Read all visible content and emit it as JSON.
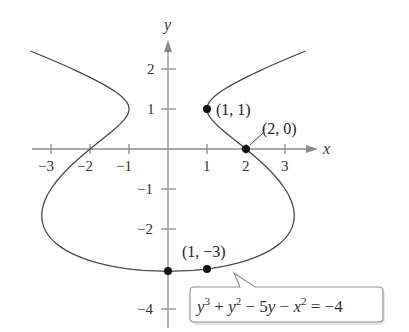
{
  "chart_data": {
    "type": "line",
    "title": "",
    "xlabel": "x",
    "ylabel": "y",
    "equation": "y^3 + y^2 - 5y - x^2 = -4",
    "xlim": [
      -3.4,
      3.9
    ],
    "ylim": [
      -4.5,
      3.0
    ],
    "grid": false,
    "x_ticks": [
      -3,
      -2,
      -1,
      1,
      2,
      3
    ],
    "x_tick_labels": [
      "−3",
      "−2",
      "−1",
      "1",
      "2",
      "3"
    ],
    "y_ticks": [
      2,
      1,
      -1,
      -2,
      -4
    ],
    "y_tick_labels": [
      "2",
      "1",
      "−1",
      "−2",
      "−4"
    ],
    "series": [
      {
        "name": "y^3 + y^2 - 5y - x^2 = -4",
        "relation": "x^2 = y^3 + y^2 - 5y + 4",
        "y_range": [
          -3.06,
          2.45
        ],
        "symmetric_about": "y-axis"
      }
    ],
    "points": [
      {
        "x": 1,
        "y": 1,
        "label": "(1, 1)"
      },
      {
        "x": 2,
        "y": 0,
        "label": "(2, 0)"
      },
      {
        "x": 1,
        "y": -3,
        "label": "(1, −3)"
      },
      {
        "x": 0,
        "y": -3.06,
        "label": ""
      }
    ],
    "annotations": [
      {
        "type": "callout",
        "text": "y³ + y² − 5y − x² = −4"
      }
    ]
  },
  "labels": {
    "x_axis": "x",
    "y_axis": "y",
    "pt_1_1": "(1, 1)",
    "pt_2_0": "(2, 0)",
    "pt_1_m3": "(1, −3)",
    "ticks": {
      "xm3": "−3",
      "xm2": "−2",
      "xm1": "−1",
      "x1": "1",
      "x2": "2",
      "x3": "3",
      "y2": "2",
      "y1": "1",
      "ym1": "−1",
      "ym2": "−2",
      "ym4": "−4"
    },
    "equation": {
      "y1": "y",
      "e1": "3",
      "plus1": " + ",
      "y2": "y",
      "e2": "2",
      "minus1": " − 5",
      "y3": "y",
      "minus2": " − ",
      "x1": "x",
      "e3": "2",
      "rhs": " = −4"
    }
  }
}
